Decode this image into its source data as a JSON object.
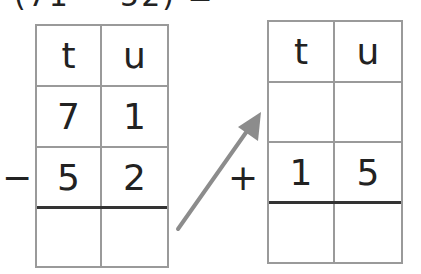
{
  "header": {
    "clipped_text": "(71 − 52) = "
  },
  "left_table": {
    "headers": [
      "t",
      "u"
    ],
    "rows": [
      [
        "7",
        "1"
      ],
      [
        "5",
        "2"
      ],
      [
        "",
        ""
      ]
    ],
    "operator": "−"
  },
  "right_table": {
    "headers": [
      "t",
      "u"
    ],
    "rows": [
      [
        "",
        ""
      ],
      [
        "1",
        "5"
      ],
      [
        "",
        ""
      ]
    ],
    "operator": "+"
  },
  "arrow": {
    "color": "#8c8c8c",
    "direction": "up-right"
  },
  "colors": {
    "grid": "#9a9a9a",
    "answer_line": "#333333",
    "text": "#222222"
  }
}
